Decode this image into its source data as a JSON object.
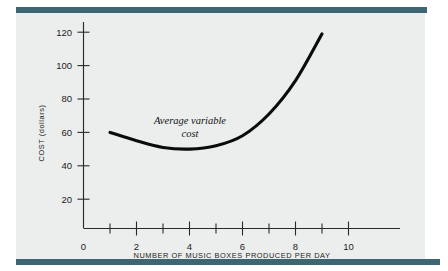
{
  "figure": {
    "background_color": "#eceeee",
    "rule_color": "#3e6672",
    "curve_color": "#0b0b0b"
  },
  "chart_data": {
    "type": "line",
    "title": "",
    "xlabel": "NUMBER OF MUSIC BOXES PRODUCED PER DAY",
    "ylabel": "COST (dollars)",
    "xlim": [
      0,
      11.2
    ],
    "ylim": [
      0,
      130
    ],
    "grid": false,
    "legend_position": "none",
    "x_ticks_major": [
      0,
      2,
      4,
      6,
      8,
      10
    ],
    "x_ticks_minor": [
      1,
      3,
      5,
      7,
      9
    ],
    "x_tick_labels": [
      "0",
      "2",
      "4",
      "6",
      "8",
      "10"
    ],
    "y_ticks_major": [
      20,
      40,
      60,
      80,
      100,
      120
    ],
    "y_tick_labels": [
      "20",
      "40",
      "60",
      "80",
      "100",
      "120"
    ],
    "series": [
      {
        "name": "Average variable cost",
        "x": [
          1,
          2,
          3,
          4,
          5,
          6,
          7,
          8,
          9
        ],
        "values": [
          60,
          55,
          51,
          50,
          52,
          58,
          71,
          91,
          119
        ]
      }
    ],
    "annotations": [
      {
        "text_line_1": "Average variable",
        "text_line_2": "cost",
        "x": 4,
        "y": 66
      }
    ]
  },
  "axis_labels": {
    "y_title": "COST (dollars)",
    "x_title": "NUMBER OF MUSIC BOXES PRODUCED PER DAY",
    "y_120": "120",
    "y_100": "100",
    "y_80": "80",
    "y_60": "60",
    "y_40": "40",
    "y_20": "20",
    "x_0": "0",
    "x_2": "2",
    "x_4": "4",
    "x_6": "6",
    "x_8": "8",
    "x_10": "10"
  },
  "annotation": {
    "line1": "Average variable",
    "line2": "cost"
  }
}
